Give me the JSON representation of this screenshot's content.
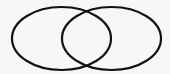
{
  "diagram": {
    "type": "venn",
    "background": "#f7f7f7",
    "stroke_color": "#111111",
    "stroke_width": 2.2,
    "sets": [
      {
        "name": "left-set",
        "cx": 61.5,
        "cy": 38.5,
        "rx": 49.5,
        "ry": 31.5
      },
      {
        "name": "right-set",
        "cx": 111.5,
        "cy": 38.5,
        "rx": 49.5,
        "ry": 31.5
      }
    ]
  }
}
